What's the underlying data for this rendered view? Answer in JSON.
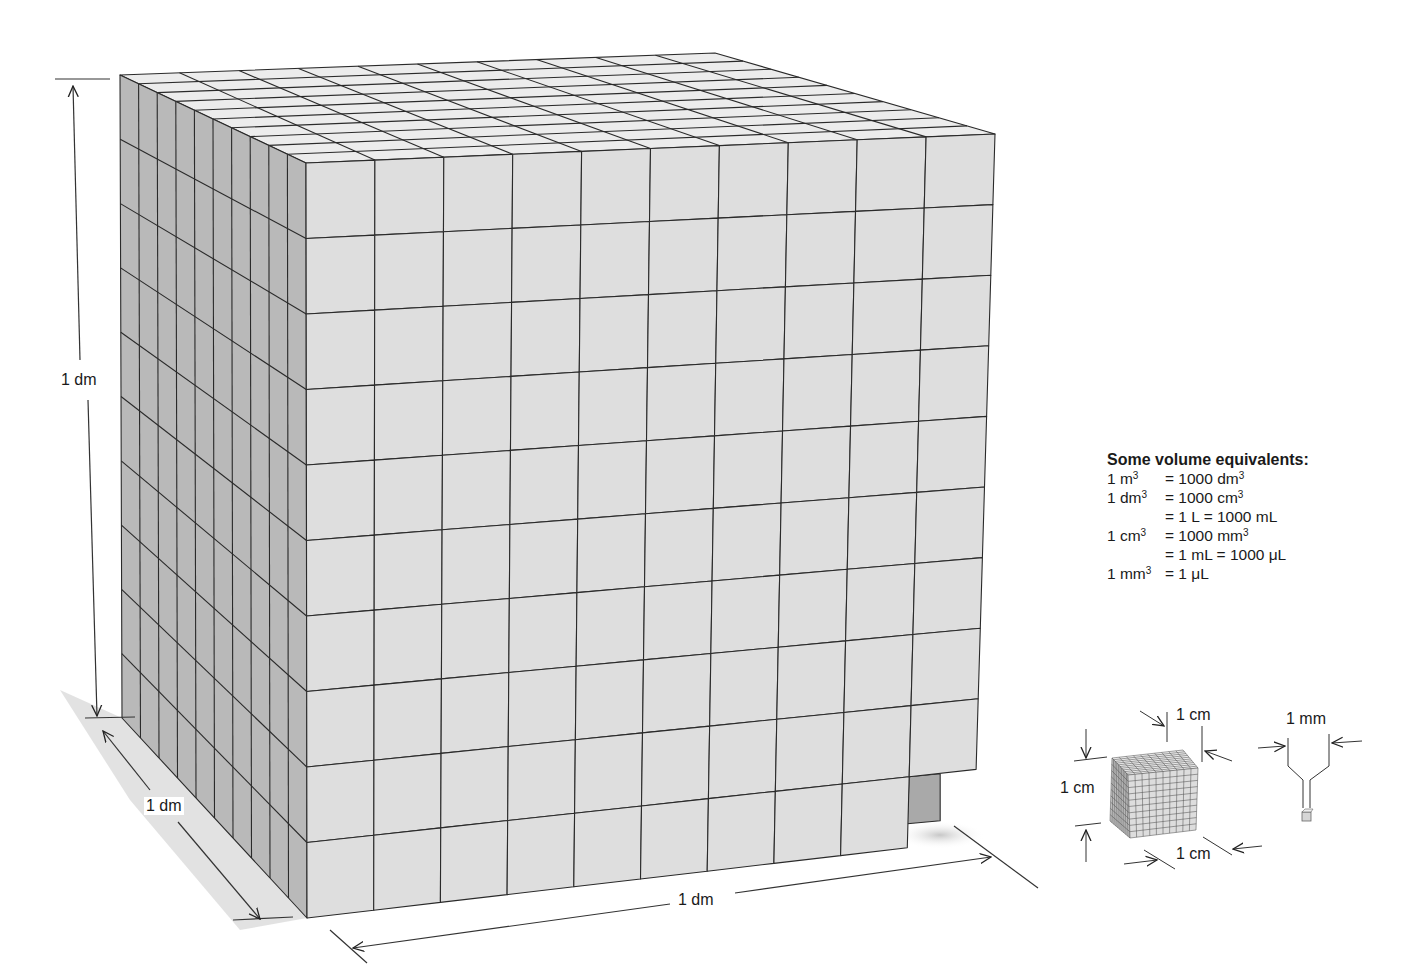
{
  "figure": {
    "big_cube": {
      "grid_divisions": 10,
      "face_colors": {
        "front": "#dedede",
        "side": "#b9b9b9",
        "top": "#ececec",
        "missing_block_side": "#a9a9a9",
        "edge": "#2a2a2a"
      },
      "missing_block": "front-bottom-right unit cube removed"
    },
    "dimension_labels": {
      "height": "1 dm",
      "depth": "1 dm",
      "width": "1 dm"
    },
    "small_cube": {
      "grid_divisions": 10,
      "height_label": "1 cm",
      "depth_label": "1 cm",
      "width_label": "1 cm"
    },
    "tiny_cube": {
      "label": "1 mm"
    }
  },
  "legend": {
    "title": "Some volume equivalents:",
    "rows": [
      {
        "lhs": "1 m",
        "lhs_exp": "3",
        "rhs": "= 1000 dm",
        "rhs_exp": "3"
      },
      {
        "lhs": "1 dm",
        "lhs_exp": "3",
        "rhs": "= 1000 cm",
        "rhs_exp": "3"
      },
      {
        "lhs": "",
        "lhs_exp": "",
        "rhs": "= 1 L = 1000 mL",
        "rhs_exp": ""
      },
      {
        "lhs": "1 cm",
        "lhs_exp": "3",
        "rhs": "= 1000 mm",
        "rhs_exp": "3"
      },
      {
        "lhs": "",
        "lhs_exp": "",
        "rhs": "= 1 mL = 1000 μL",
        "rhs_exp": ""
      },
      {
        "lhs": "1 mm",
        "lhs_exp": "3",
        "rhs": "= 1 μL",
        "rhs_exp": ""
      }
    ]
  }
}
